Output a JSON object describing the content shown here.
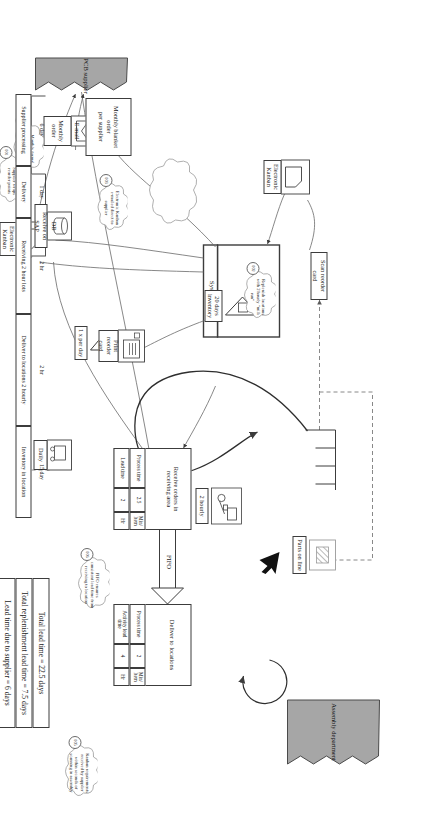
{
  "page": {
    "header_faint": "",
    "bg": "#ffffff",
    "line_color": "#3c3c3c",
    "fill_grey": "#a6a6a6"
  },
  "entities": {
    "supplier": "PCB supplier",
    "customer": "Assembly department",
    "system": "SAP",
    "system_sub": "System"
  },
  "info_boxes": [
    {
      "name": "monthly-blanket-order",
      "label": "Monthly blanket order\nper supplier"
    },
    {
      "name": "monthly-order",
      "label": "Monthly order"
    },
    {
      "name": "email",
      "label": "E-mail"
    },
    {
      "name": "electronic-kanban-supplier",
      "label": "Electronic\nKanban"
    },
    {
      "name": "electronic-kanban-receiving",
      "label": "Electronic\nKanban"
    },
    {
      "name": "daily",
      "label": "Daily"
    },
    {
      "name": "receive-on-sap",
      "label": "Receive on SAP"
    },
    {
      "name": "db",
      "label": "DB"
    },
    {
      "name": "print-reorder-card",
      "label": "Print reorder\ncard"
    },
    {
      "name": "one-per-day",
      "label": "1 x per day"
    },
    {
      "name": "inventory-20-days",
      "label": "20 days\ninventory"
    },
    {
      "name": "two-hourly",
      "label": "2 hourly"
    },
    {
      "name": "scan-reorder-card",
      "label": "Scan reorder card"
    },
    {
      "name": "parts-on-line",
      "label": "Parts on line"
    }
  ],
  "processes": [
    {
      "name": "receive-orders",
      "title": "Receive orders in\nreceiving area",
      "rows": [
        {
          "label": "Process time",
          "value": "2.5",
          "unit": "Min/\nItem"
        },
        {
          "label": "Lead time",
          "value": "2",
          "unit": "Hr"
        }
      ]
    },
    {
      "name": "deliver-to-locations",
      "title": "Deliver to locations",
      "rows": [
        {
          "label": "Process time",
          "value": "2",
          "unit": "Min/\nItem"
        },
        {
          "label": "Activity lead\ntime",
          "value": "4",
          "unit": "Hr"
        }
      ]
    }
  ],
  "flow_labels": {
    "fifo": "FIFO"
  },
  "annotations": [
    {
      "id": "001",
      "text": "Supplier wraps\nreorder points"
    },
    {
      "id": "003",
      "text": "Electronic Kanban\ne-mailed direct to\nsupplier"
    },
    {
      "id": "004",
      "text": "Monthly formal\npurchase order for\ngovernance"
    },
    {
      "id": "005",
      "text": "Kanban requirements\nreceived by supplier\nwithin seconds of\nscanning in assembly"
    },
    {
      "id": "006",
      "text": "FIFO ensures\nconsistent lead time from\nreceiving to location"
    },
    {
      "id": "002",
      "text": "Replenish locations\nwith 2 hourly “milk\nrun”"
    }
  ],
  "timeline": {
    "segments": [
      {
        "name": "supplier-processing",
        "label": "Supplier processing",
        "time": "6 day"
      },
      {
        "name": "delivery",
        "label": "Delivery",
        "time": "1 day"
      },
      {
        "name": "receiving-2-hour-lots",
        "label": "Receiving 2 hour lots",
        "time": "2 hr"
      },
      {
        "name": "deliver-to-locations-2-hourly",
        "label": "Deliver to locations 2 hourly",
        "time": "2 hr"
      },
      {
        "name": "inventory-in-location",
        "label": "Inventory in location",
        "time": "15 day"
      }
    ]
  },
  "summary": [
    {
      "name": "total-lead-time",
      "text": "Total lead time = 22.5 days"
    },
    {
      "name": "total-replenishment-lead-time",
      "text": "Total replenishment lead time = 7.5 days"
    },
    {
      "name": "lead-time-due-to-supplier",
      "text": "Lead time due to supplier = 6 days"
    }
  ]
}
